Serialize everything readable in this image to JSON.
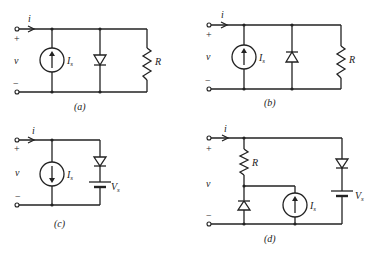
{
  "figure": {
    "circuits": [
      {
        "id": "a",
        "caption": "(a)",
        "current_label": "i",
        "voltage_label": "v",
        "plus_sign": "+",
        "minus_sign": "−",
        "source_label": "I",
        "source_subscript": "s",
        "source_direction": "up",
        "diode_direction": "down",
        "resistor_label": "R"
      },
      {
        "id": "b",
        "caption": "(b)",
        "current_label": "i",
        "voltage_label": "v",
        "plus_sign": "+",
        "minus_sign": "−",
        "source_label": "I",
        "source_subscript": "s",
        "source_direction": "up",
        "diode_direction": "up",
        "resistor_label": "R"
      },
      {
        "id": "c",
        "caption": "(c)",
        "current_label": "i",
        "voltage_label": "v",
        "plus_sign": "+",
        "minus_sign": "−",
        "source_label": "I",
        "source_subscript": "s",
        "source_direction": "down",
        "diode_direction": "down",
        "battery_label": "V",
        "battery_subscript": "s"
      },
      {
        "id": "d",
        "caption": "(d)",
        "current_label": "i",
        "voltage_label": "v",
        "plus_sign": "+",
        "minus_sign": "−",
        "resistor_label": "R",
        "source_label": "I",
        "source_subscript": "s",
        "source_direction": "up",
        "left_diode_direction": "up",
        "right_diode_direction": "down",
        "battery_label": "V",
        "battery_subscript": "s"
      }
    ]
  }
}
